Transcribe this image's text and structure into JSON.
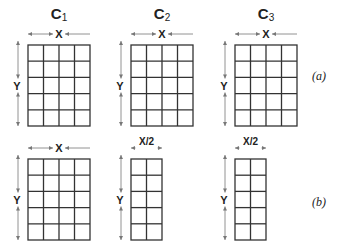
{
  "figure": {
    "rows": [
      {
        "caption": "(a)",
        "panels": [
          {
            "title": "C",
            "subscript": "1",
            "width_label": "X",
            "height_label": "Y",
            "columns": 4,
            "rows": 5
          },
          {
            "title": "C",
            "subscript": "2",
            "width_label": "X",
            "height_label": "Y",
            "columns": 4,
            "rows": 5
          },
          {
            "title": "C",
            "subscript": "3",
            "width_label": "X",
            "height_label": "Y",
            "columns": 4,
            "rows": 5
          }
        ]
      },
      {
        "caption": "(b)",
        "panels": [
          {
            "title": "",
            "subscript": "",
            "width_label": "X",
            "height_label": "Y",
            "columns": 4,
            "rows": 5
          },
          {
            "title": "",
            "subscript": "",
            "width_label": "X/2",
            "height_label": "Y",
            "columns": 2,
            "rows": 5
          },
          {
            "title": "",
            "subscript": "",
            "width_label": "X/2",
            "height_label": "Y",
            "columns": 2,
            "rows": 5
          }
        ]
      }
    ]
  }
}
